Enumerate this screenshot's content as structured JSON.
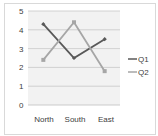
{
  "chart_data": {
    "type": "line",
    "title": "",
    "xlabel": "",
    "ylabel": "",
    "categories": [
      "North",
      "South",
      "East"
    ],
    "series": [
      {
        "name": "Q1",
        "values": [
          4.3,
          2.5,
          3.5
        ],
        "color": "#595959",
        "marker": "diamond"
      },
      {
        "name": "Q2",
        "values": [
          2.4,
          4.4,
          1.8
        ],
        "color": "#a6a6a6",
        "marker": "square"
      }
    ],
    "ylim": [
      0,
      5
    ],
    "yticks": [
      "0",
      "1",
      "2",
      "3",
      "4",
      "5"
    ],
    "grid": true,
    "legend_position": "right",
    "plot_background": "#f2f2f2"
  }
}
